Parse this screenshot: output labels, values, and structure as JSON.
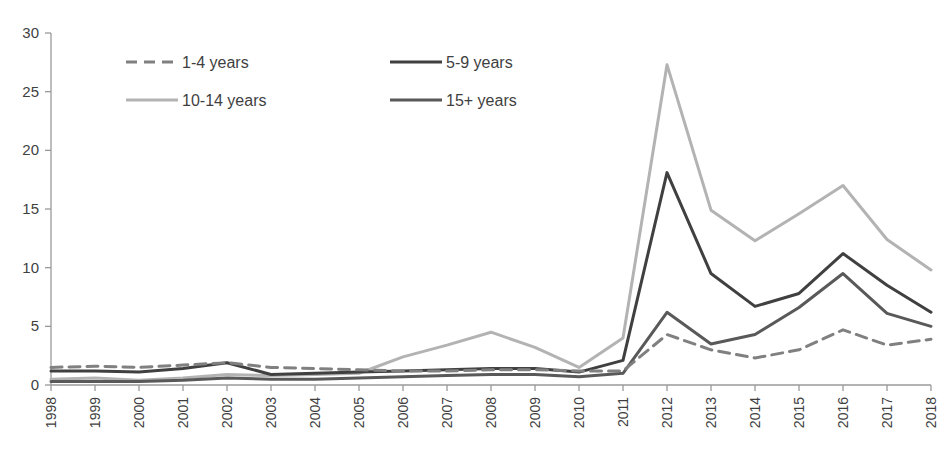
{
  "chart_data": {
    "type": "line",
    "title": "",
    "xlabel": "",
    "ylabel": "",
    "xlim": [
      1998,
      2018
    ],
    "ylim": [
      0,
      30
    ],
    "yticks": [
      0,
      5,
      10,
      15,
      20,
      25,
      30
    ],
    "grid": false,
    "legend_position": "top-left",
    "x": [
      1998,
      1999,
      2000,
      2001,
      2002,
      2003,
      2004,
      2005,
      2006,
      2007,
      2008,
      2009,
      2010,
      2011,
      2012,
      2013,
      2014,
      2015,
      2016,
      2017,
      2018
    ],
    "categories": [
      "1998",
      "1999",
      "2000",
      "2001",
      "2002",
      "2003",
      "2004",
      "2005",
      "2006",
      "2007",
      "2008",
      "2009",
      "2010",
      "2011",
      "2012",
      "2013",
      "2014",
      "2015",
      "2016",
      "2017",
      "2018"
    ],
    "series": [
      {
        "name": "1-4 years",
        "color": "#808080",
        "style": "dashed",
        "width": 3.0,
        "values": [
          1.5,
          1.6,
          1.5,
          1.7,
          1.9,
          1.5,
          1.4,
          1.3,
          1.2,
          1.2,
          1.3,
          1.3,
          1.2,
          1.2,
          4.3,
          3.0,
          2.3,
          3.0,
          4.7,
          3.4,
          3.9
        ]
      },
      {
        "name": "5-9 years",
        "color": "#404040",
        "style": "solid",
        "width": 3.0,
        "values": [
          1.2,
          1.2,
          1.1,
          1.4,
          1.9,
          0.9,
          1.0,
          1.1,
          1.2,
          1.3,
          1.4,
          1.4,
          1.1,
          2.1,
          18.1,
          9.5,
          6.7,
          7.8,
          11.2,
          8.5,
          6.2
        ]
      },
      {
        "name": "10-14 years",
        "color": "#b3b3b3",
        "style": "solid",
        "width": 3.0,
        "values": [
          0.5,
          0.6,
          0.4,
          0.6,
          0.9,
          0.8,
          0.9,
          1.0,
          2.4,
          3.4,
          4.5,
          3.2,
          1.5,
          4.0,
          27.3,
          14.9,
          12.3,
          14.6,
          17.0,
          12.4,
          9.8
        ]
      },
      {
        "name": "15+ years",
        "color": "#595959",
        "style": "solid",
        "width": 3.0,
        "values": [
          0.3,
          0.3,
          0.3,
          0.4,
          0.6,
          0.5,
          0.5,
          0.6,
          0.7,
          0.8,
          0.9,
          0.9,
          0.7,
          1.0,
          6.2,
          3.5,
          4.3,
          6.6,
          9.5,
          6.1,
          5.0
        ]
      }
    ]
  },
  "legend": {
    "items": [
      {
        "label": "1-4 years"
      },
      {
        "label": "5-9 years"
      },
      {
        "label": "10-14 years"
      },
      {
        "label": "15+ years"
      }
    ]
  },
  "axes": {
    "y_tick_labels": [
      "30",
      "25",
      "20",
      "15",
      "10",
      "5",
      "0"
    ],
    "x_tick_labels": [
      "1998",
      "1999",
      "2000",
      "2001",
      "2002",
      "2003",
      "2004",
      "2005",
      "2006",
      "2007",
      "2008",
      "2009",
      "2010",
      "2011",
      "2012",
      "2013",
      "2014",
      "2015",
      "2016",
      "2017",
      "2018"
    ]
  },
  "colors": {
    "axis": "#9a9a9a",
    "text": "#3f3f3f",
    "series_1_4": "#808080",
    "series_5_9": "#404040",
    "series_10_14": "#b3b3b3",
    "series_15_plus": "#595959"
  }
}
